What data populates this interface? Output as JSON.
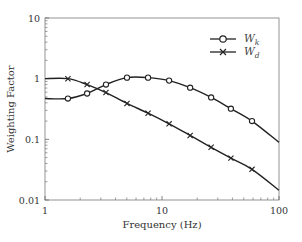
{
  "chart_data": {
    "type": "line",
    "title": "",
    "xlabel": "Frequency (Hz)",
    "ylabel": "Weighting Factor",
    "xscale": "log",
    "yscale": "log",
    "xlim": [
      1,
      100
    ],
    "ylim": [
      0.01,
      10
    ],
    "x_ticks": [
      "1",
      "10",
      "100"
    ],
    "y_ticks": [
      "0.01",
      "0.1",
      "1",
      "10"
    ],
    "grid": false,
    "legend_position": "upper right",
    "series": [
      {
        "name": "W_k",
        "label_main": "W",
        "label_sub": "k",
        "marker": "circle",
        "x": [
          1,
          1.57,
          2.29,
          3.32,
          5.02,
          7.6,
          11.5,
          17.4,
          26.3,
          38.8,
          58.8,
          100
        ],
        "values": [
          0.47,
          0.47,
          0.57,
          0.8,
          1.04,
          1.04,
          0.93,
          0.71,
          0.49,
          0.32,
          0.2,
          0.089
        ],
        "marker_indices": [
          1,
          2,
          3,
          4,
          5,
          6,
          7,
          8,
          9,
          10
        ]
      },
      {
        "name": "W_d",
        "label_main": "W",
        "label_sub": "d",
        "marker": "x",
        "x": [
          1,
          1.57,
          2.29,
          3.32,
          5.02,
          7.6,
          11.5,
          17.4,
          26.3,
          38.8,
          58.8,
          100
        ],
        "values": [
          1.0,
          1.0,
          0.8,
          0.59,
          0.39,
          0.27,
          0.18,
          0.116,
          0.074,
          0.049,
          0.032,
          0.0145
        ],
        "marker_indices": [
          1,
          2,
          3,
          4,
          5,
          6,
          7,
          8,
          9,
          10
        ]
      }
    ]
  }
}
